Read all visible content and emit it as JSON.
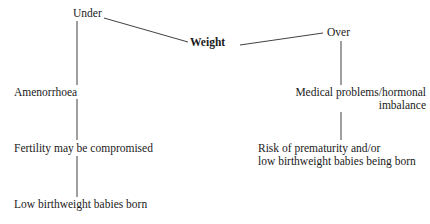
{
  "diagram": {
    "type": "flowchart",
    "title": "Weight",
    "background_color": "#ffffff",
    "line_color": "#2b2b2b",
    "text_color": "#1a1a1a",
    "nodes": [
      {
        "id": "under",
        "label": "Under",
        "emphasis": "normal",
        "align": "left",
        "x": 73,
        "y": 7,
        "branch": "under"
      },
      {
        "id": "weight",
        "label": "Weight",
        "emphasis": "bold",
        "align": "left",
        "x": 190,
        "y": 36,
        "branch": "root"
      },
      {
        "id": "over",
        "label": "Over",
        "emphasis": "normal",
        "align": "left",
        "x": 327,
        "y": 26,
        "branch": "over"
      },
      {
        "id": "amenorrhoea",
        "label": "Amenorrhoea",
        "emphasis": "normal",
        "align": "left",
        "x": 14,
        "y": 86,
        "branch": "under"
      },
      {
        "id": "medical-problems",
        "label": "Medical problems/hormonal\nimbalance",
        "emphasis": "normal",
        "align": "right",
        "x": 278,
        "y": 86,
        "branch": "over"
      },
      {
        "id": "fertility",
        "label": "Fertility may be compromised",
        "emphasis": "normal",
        "align": "left",
        "x": 14,
        "y": 142,
        "branch": "under"
      },
      {
        "id": "prematurity-risk",
        "label": "Risk of prematurity and/or\nlow birthweight babies being born",
        "emphasis": "normal",
        "align": "left",
        "x": 258,
        "y": 142,
        "branch": "over"
      },
      {
        "id": "low-birthweight",
        "label": "Low birthweight babies born",
        "emphasis": "normal",
        "align": "left",
        "x": 14,
        "y": 198,
        "branch": "under"
      }
    ],
    "connectors": [
      {
        "id": "under-to-weight",
        "from": "under",
        "to": "weight",
        "x1": 104,
        "y1": 18,
        "x2": 188,
        "y2": 42
      },
      {
        "id": "weight-to-over",
        "from": "weight",
        "to": "over",
        "x1": 240,
        "y1": 45,
        "x2": 323,
        "y2": 33
      },
      {
        "id": "under-to-amenorrhoea",
        "from": "under",
        "to": "amenorrhoea",
        "x1": 77,
        "y1": 21,
        "x2": 77,
        "y2": 85
      },
      {
        "id": "amenorrhoea-to-fertility",
        "from": "amenorrhoea",
        "to": "fertility",
        "x1": 77,
        "y1": 99,
        "x2": 77,
        "y2": 140
      },
      {
        "id": "fertility-to-low-birthweight",
        "from": "fertility",
        "to": "low-birthweight",
        "x1": 77,
        "y1": 156,
        "x2": 77,
        "y2": 197
      },
      {
        "id": "over-to-medical-problems",
        "from": "over",
        "to": "medical-problems",
        "x1": 341,
        "y1": 41,
        "x2": 341,
        "y2": 85
      },
      {
        "id": "medical-problems-to-prematurity",
        "from": "medical-problems",
        "to": "prematurity-risk",
        "x1": 341,
        "y1": 112,
        "x2": 341,
        "y2": 140
      }
    ]
  }
}
